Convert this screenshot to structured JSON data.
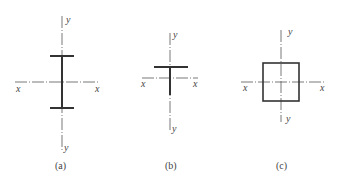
{
  "figures": [
    {
      "id": "a",
      "shape": "I-section (two flanges, web)",
      "caption": "(a)",
      "axis_labels": {
        "x_left": "x",
        "x_right": "x",
        "y_top": "y",
        "y_bottom": "y"
      }
    },
    {
      "id": "b",
      "shape": "T-section",
      "caption": "(b)",
      "axis_labels": {
        "x_left": "x",
        "x_right": "x",
        "y_top": "y",
        "y_bottom": "y"
      }
    },
    {
      "id": "c",
      "shape": "Hollow square section",
      "caption": "(c)",
      "axis_labels": {
        "x_left": "x",
        "x_right": "x",
        "y_top": "y",
        "y_bottom": "y"
      }
    }
  ],
  "colors": {
    "line": "#333333",
    "axis": "#555555",
    "text": "#444444",
    "background": "#ffffff"
  }
}
